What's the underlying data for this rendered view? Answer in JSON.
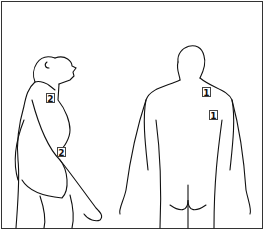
{
  "diagram": {
    "figures": [
      {
        "id": "side-view",
        "label": "lateral view"
      },
      {
        "id": "back-view",
        "label": "posterior view"
      }
    ],
    "markers": [
      {
        "label": "2",
        "x": 46,
        "y": 93,
        "figure": "side-view"
      },
      {
        "label": "2",
        "x": 57,
        "y": 147,
        "figure": "side-view"
      },
      {
        "label": "1",
        "x": 202,
        "y": 87,
        "figure": "back-view"
      },
      {
        "label": "1",
        "x": 209,
        "y": 110,
        "figure": "back-view"
      }
    ]
  }
}
